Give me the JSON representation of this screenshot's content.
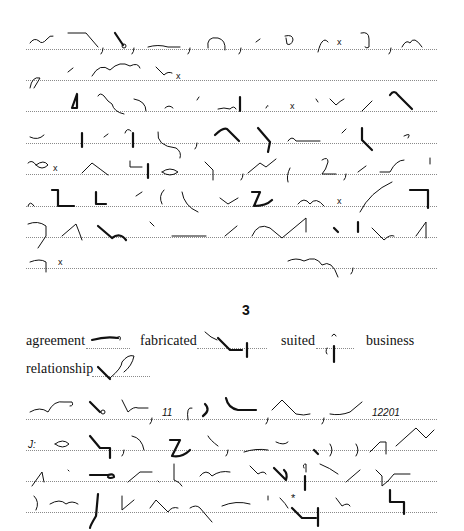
{
  "page": {
    "type": "Pitman shorthand exercise page",
    "upper_passage": {
      "line_count": 8,
      "line_y": [
        49,
        80,
        111,
        143,
        174,
        206,
        237,
        268
      ],
      "end_marks": [
        "x",
        "x",
        "x",
        "x",
        "x",
        "x"
      ]
    },
    "section_number": "3",
    "vocabulary": [
      {
        "word": "agreement"
      },
      {
        "word": "fabricated"
      },
      {
        "word": "suited"
      },
      {
        "word": "business"
      },
      {
        "word": "relationship"
      }
    ],
    "lower_passage": {
      "line_count": 4,
      "line_y": [
        419,
        450,
        481,
        512
      ],
      "numbers": [
        "11",
        "12201"
      ],
      "colon_prefix": "J:",
      "asterisk": "*"
    },
    "colors": {
      "ink": "#111111",
      "rule": "#8a8a8a",
      "background": "#ffffff"
    }
  }
}
